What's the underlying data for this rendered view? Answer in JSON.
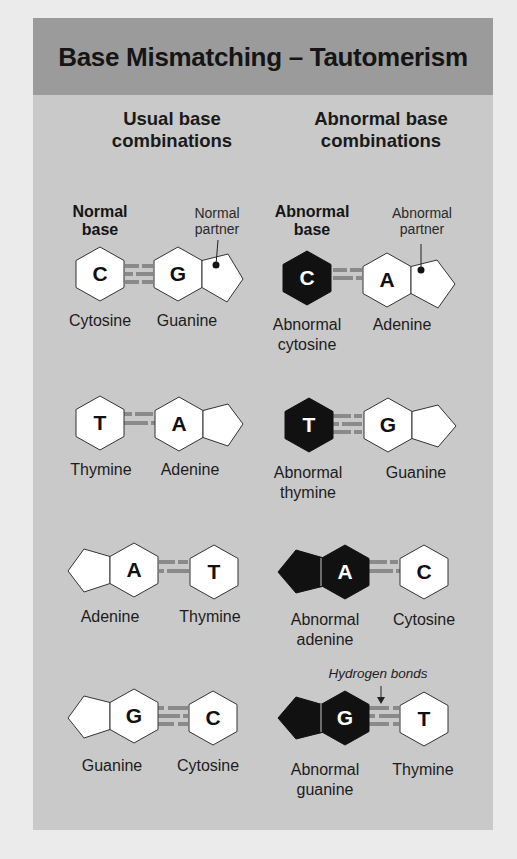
{
  "title": "Base Mismatching – Tautomerism",
  "colors": {
    "header_bg": "#9b9b9b",
    "panel_bg": "#c9c9c9",
    "normal_base_fill": "#ffffff",
    "abnormal_base_fill": "#111111",
    "bond_color": "#8a8a8a"
  },
  "columns": {
    "usual": {
      "line1": "Usual base",
      "line2": "combinations"
    },
    "abnormal": {
      "line1": "Abnormal base",
      "line2": "combinations"
    }
  },
  "annotations": {
    "normal_base": {
      "line1": "Normal",
      "line2": "base"
    },
    "normal_partner": {
      "line1": "Normal",
      "line2": "partner"
    },
    "abnormal_base": {
      "line1": "Abnormal",
      "line2": "base"
    },
    "abnormal_partner": {
      "line1": "Abnormal",
      "line2": "partner"
    },
    "hydrogen_bonds": "Hydrogen bonds"
  },
  "rows": [
    {
      "usual": {
        "left": {
          "letter": "C",
          "name": "Cytosine"
        },
        "right": {
          "letter": "G",
          "name": "Guanine"
        },
        "bonds": 3
      },
      "abnormal": {
        "left": {
          "letter": "C",
          "line1": "Abnormal",
          "line2": "cytosine"
        },
        "right": {
          "letter": "A",
          "name": "Adenine"
        },
        "bonds": 2
      }
    },
    {
      "usual": {
        "left": {
          "letter": "T",
          "name": "Thymine"
        },
        "right": {
          "letter": "A",
          "name": "Adenine"
        },
        "bonds": 2
      },
      "abnormal": {
        "left": {
          "letter": "T",
          "line1": "Abnormal",
          "line2": "thymine"
        },
        "right": {
          "letter": "G",
          "name": "Guanine"
        },
        "bonds": 3
      }
    },
    {
      "usual": {
        "left": {
          "letter": "A",
          "name": "Adenine"
        },
        "right": {
          "letter": "T",
          "name": "Thymine"
        },
        "bonds": 2
      },
      "abnormal": {
        "left": {
          "letter": "A",
          "line1": "Abnormal",
          "line2": "adenine"
        },
        "right": {
          "letter": "C",
          "name": "Cytosine"
        },
        "bonds": 2
      }
    },
    {
      "usual": {
        "left": {
          "letter": "G",
          "name": "Guanine"
        },
        "right": {
          "letter": "C",
          "name": "Cytosine"
        },
        "bonds": 3
      },
      "abnormal": {
        "left": {
          "letter": "G",
          "line1": "Abnormal",
          "line2": "guanine"
        },
        "right": {
          "letter": "T",
          "name": "Thymine"
        },
        "bonds": 3
      }
    }
  ]
}
